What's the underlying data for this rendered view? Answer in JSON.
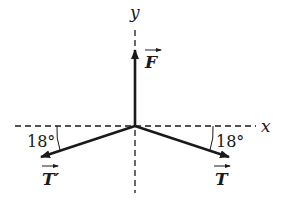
{
  "diagram": {
    "type": "force-vector-diagram",
    "axes": {
      "x_label": "x",
      "y_label": "y"
    },
    "vectors": [
      {
        "id": "F",
        "label": "F",
        "direction": "up",
        "angle_label": ""
      },
      {
        "id": "T",
        "label": "T",
        "direction": "down-right",
        "angle_label": "18°"
      },
      {
        "id": "T_prime",
        "label": "T′",
        "direction": "down-left",
        "angle_label": "18°"
      }
    ],
    "colors": {
      "line": "#1a1a1a",
      "background": "#ffffff"
    }
  }
}
